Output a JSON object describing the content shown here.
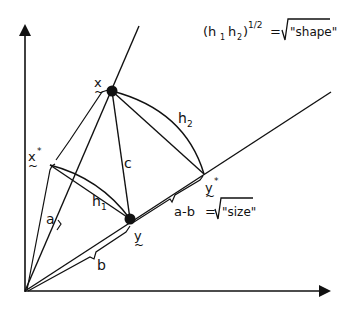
{
  "diagram": {
    "colors": {
      "ink": "#111111",
      "background": "#ffffff"
    },
    "formula_shape": {
      "lhs": "(h",
      "sub1": "1",
      "mid": "h",
      "sub2": "2",
      "close": ")",
      "exp": "1/2",
      "eq": "=",
      "rhs": "\"shape\""
    },
    "formula_size": {
      "lhs": "a-b",
      "eq": "=",
      "rhs": "\"size\""
    },
    "points": {
      "x": "x",
      "x_star": "x",
      "y": "y",
      "y_star": "y",
      "star": "*"
    },
    "segment_labels": {
      "a": "a",
      "b": "b",
      "c": "c",
      "h1": "h",
      "h1_sub": "1",
      "h2": "h",
      "h2_sub": "2"
    }
  }
}
